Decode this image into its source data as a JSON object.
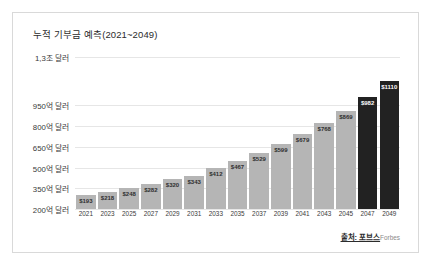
{
  "frame": {
    "border_color": "#d9d9d9",
    "background": "#ffffff"
  },
  "title": "누적 기부금 예측(2021~2049)",
  "source": {
    "prefix": "출처: 포브스",
    "suffix": "Forbes"
  },
  "colors": {
    "bar_gray": "#b5b5b5",
    "bar_dark": "#222222",
    "gridline": "#e6e6e6",
    "text": "#3a3a3a"
  },
  "chart_data": {
    "type": "bar",
    "title": "누적 기부금 예측(2021~2049)",
    "xlabel": "",
    "ylabel": "",
    "grid": true,
    "legend": "none",
    "categories": [
      "2021",
      "2023",
      "2025",
      "2027",
      "2029",
      "2031",
      "2033",
      "2035",
      "2037",
      "2039",
      "2041",
      "2043",
      "2045",
      "2047",
      "2049"
    ],
    "values": [
      193,
      218,
      248,
      282,
      320,
      343,
      412,
      467,
      529,
      599,
      679,
      768,
      869,
      982,
      1110
    ],
    "value_labels": [
      "$193",
      "$218",
      "$248",
      "$282",
      "$320",
      "$343",
      "$412",
      "$467",
      "$529",
      "$599",
      "$679",
      "$768",
      "$869",
      "$982",
      "$1110"
    ],
    "bar_colors": [
      "#b5b5b5",
      "#b5b5b5",
      "#b5b5b5",
      "#b5b5b5",
      "#b5b5b5",
      "#b5b5b5",
      "#b5b5b5",
      "#b5b5b5",
      "#b5b5b5",
      "#b5b5b5",
      "#b5b5b5",
      "#b5b5b5",
      "#b5b5b5",
      "#222222",
      "#222222"
    ],
    "ytick_labels": [
      "1,3조 달러",
      "950억 달러",
      "800억 달러",
      "650억 달러",
      "500억 달러",
      "350억 달러",
      "200억 달러"
    ],
    "ytick_values": [
      1300,
      950,
      800,
      650,
      500,
      350,
      200
    ],
    "ylim": [
      200,
      1300
    ],
    "value_unit": "억 달러"
  }
}
